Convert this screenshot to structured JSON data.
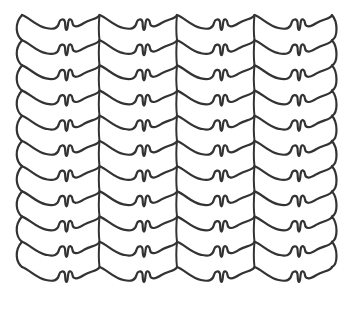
{
  "figure": {
    "background": "#ffffff",
    "stroke_color": "#333333",
    "stroke_width": 2.2
  },
  "pattern": {
    "rows": 11,
    "first_row_y": 20,
    "row_spacing": 25.2,
    "x_start": 22,
    "x_end": 335,
    "period": 77.5,
    "phase_offset": 0,
    "motifs_per_row": 4,
    "motif_parts": [
      "swoop-down",
      "double-u-notch",
      "rise",
      "peak"
    ]
  }
}
